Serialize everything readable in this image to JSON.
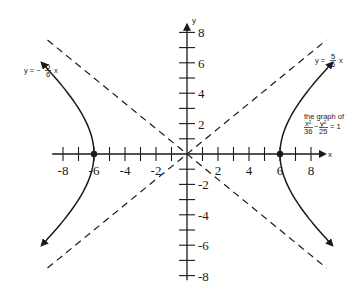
{
  "chart_data": {
    "type": "line",
    "title": "",
    "xlabel": "x",
    "ylabel": "y",
    "xlim": [
      -9,
      9
    ],
    "ylim": [
      -8.5,
      8.5
    ],
    "grid": false,
    "x_ticks": [
      -8,
      -7,
      -6,
      -5,
      -4,
      -3,
      -2,
      -1,
      1,
      2,
      3,
      4,
      5,
      6,
      7,
      8
    ],
    "x_tick_labels": [
      "-8",
      "-6",
      "-4",
      "-2",
      "2",
      "4",
      "6",
      "8"
    ],
    "x_tick_label_values": [
      -8,
      -6,
      -4,
      -2,
      2,
      4,
      6,
      8
    ],
    "y_ticks": [
      -8,
      -7,
      -6,
      -5,
      -4,
      -3,
      -2,
      -1,
      1,
      2,
      3,
      4,
      5,
      6,
      7,
      8
    ],
    "y_tick_labels": [
      "8",
      "6",
      "4",
      "2",
      "-2",
      "-4",
      "-6",
      "-8"
    ],
    "y_tick_label_values": [
      8,
      6,
      4,
      2,
      -2,
      -4,
      -6,
      -8
    ],
    "series": [
      {
        "name": "hyperbola x^2/36 - y^2/25 = 1",
        "style": "solid",
        "equation": "x^2/36 - y^2/25 = 1",
        "a": 6,
        "b": 5,
        "branches": [
          "left",
          "right"
        ],
        "y_range": [
          -6,
          6
        ],
        "vertices": [
          [
            -6,
            0
          ],
          [
            6,
            0
          ]
        ]
      },
      {
        "name": "asymptote y = 5/6 x",
        "style": "dashed",
        "slope": 0.8333,
        "x_range": [
          -9,
          9
        ]
      },
      {
        "name": "asymptote y = -5/6 x",
        "style": "dashed",
        "slope": -0.8333,
        "x_range": [
          -9,
          9
        ]
      }
    ],
    "annotations": [
      {
        "text": "y = -5/6 x",
        "prefix": "y = −",
        "num": "5",
        "den": "6",
        "suffix": "x",
        "near": "upper-left asymptote"
      },
      {
        "text": "y = 5/6 x",
        "prefix": "y =",
        "num": "5",
        "den": "6",
        "suffix": "x",
        "near": "upper-right asymptote"
      },
      {
        "text": "the graph of x^2/36 - y^2/25 = 1",
        "line1": "the graph of",
        "num1": "x²",
        "den1": "36",
        "num2": "y²",
        "den2": "25",
        "rhs": "= 1"
      }
    ],
    "points": [
      [
        -6,
        0
      ],
      [
        6,
        0
      ]
    ]
  }
}
